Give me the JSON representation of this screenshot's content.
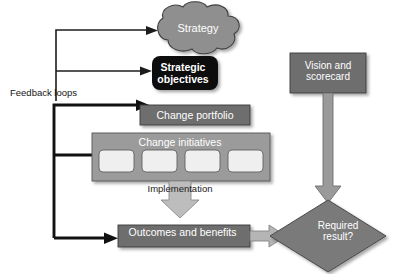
{
  "diagram": {
    "background_color": "#ffffff",
    "nodes": {
      "strategy": {
        "label": "Strategy",
        "shape": "cloud",
        "fill": "#8f8f8f",
        "text_color": "#ffffff"
      },
      "strategic_objectives": {
        "label": "Strategic\nobjectives",
        "shape": "rounded-rectangle",
        "fill": "#0d0d0d",
        "text_color": "#ffffff"
      },
      "change_portfolio": {
        "label": "Change portfolio",
        "shape": "rectangle",
        "fill": "#6e6e6e",
        "text_color": "#ffffff"
      },
      "change_initiatives": {
        "label": "Change initiatives",
        "shape": "rectangle",
        "fill": "#9b9b9b",
        "text_color": "#ffffff",
        "sub_boxes": 4,
        "sub_box_fill": "#efefef"
      },
      "outcomes_and_benefits": {
        "label": "Outcomes and benefits",
        "shape": "rectangle",
        "fill": "#6e6e6e",
        "text_color": "#ffffff"
      },
      "vision_and_scorecard": {
        "label": "Vision and\nscorecard",
        "shape": "rectangle",
        "fill": "#6e6e6e",
        "text_color": "#ffffff"
      },
      "required_result": {
        "label": "Required\nresult?",
        "shape": "diamond",
        "fill": "#7a7a7a",
        "text_color": "#ffffff"
      }
    },
    "annotations": {
      "feedback_loops": {
        "label": "Feedback loops",
        "text_color": "#141414"
      },
      "implementation": {
        "label": "Implementation",
        "text_color": "#1a1a1a"
      }
    },
    "connectors": [
      {
        "name": "feedback-to-strategy",
        "style": "thin-line-arrow",
        "color": "#1c1c1c"
      },
      {
        "name": "feedback-to-strategic-objectives",
        "style": "thin-line-arrow",
        "color": "#1c1c1c"
      },
      {
        "name": "feedback-to-change-portfolio",
        "style": "thick-line-arrow",
        "color": "#111111"
      },
      {
        "name": "feedback-to-change-initiatives",
        "style": "thick-line-arrow",
        "color": "#111111"
      },
      {
        "name": "feedback-from-outcomes",
        "style": "thick-line-arrow",
        "color": "#111111"
      },
      {
        "name": "implementation-block-arrow",
        "style": "block-arrow-down",
        "color": "#bdbdbd"
      },
      {
        "name": "outcomes-to-required-result",
        "style": "block-arrow-right",
        "color": "#b5b5b5"
      },
      {
        "name": "vision-to-required-result",
        "style": "block-arrow-down",
        "color": "#9a9a9a"
      }
    ]
  }
}
